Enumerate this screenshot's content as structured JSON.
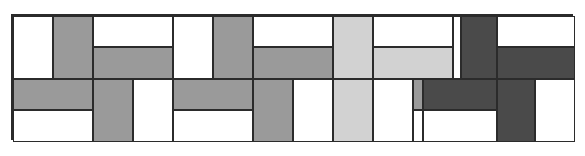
{
  "figure": {
    "border_color": "#2b2b2b",
    "background_color": "#ffffff",
    "canvas": {
      "x": 11,
      "y": 14,
      "width": 562,
      "height": 126
    }
  },
  "palette": {
    "white": "#ffffff",
    "gray": "#9a9a9a",
    "light_gray": "#d2d2d2",
    "dark_gray": "#4a4a4a",
    "outline": "#2b2b2b"
  },
  "chart_data": {
    "type": "table",
    "grid": {
      "unit_width": 40,
      "unit_height": 63,
      "columns": 14,
      "rows": 2
    },
    "legend": [
      {
        "name": "white",
        "color": "#ffffff"
      },
      {
        "name": "gray",
        "color": "#9a9a9a"
      },
      {
        "name": "light_gray",
        "color": "#d2d2d2"
      },
      {
        "name": "dark_gray",
        "color": "#4a4a4a"
      }
    ],
    "tiles": [
      {
        "x": 0,
        "y": 0,
        "w": 40,
        "h": 63,
        "fill": "#ffffff"
      },
      {
        "x": 40,
        "y": 0,
        "w": 40,
        "h": 63,
        "fill": "#9a9a9a"
      },
      {
        "x": 80,
        "y": 0,
        "w": 80,
        "h": 31,
        "fill": "#ffffff"
      },
      {
        "x": 80,
        "y": 31,
        "w": 80,
        "h": 32,
        "fill": "#9a9a9a"
      },
      {
        "x": 0,
        "y": 63,
        "w": 80,
        "h": 31,
        "fill": "#9a9a9a"
      },
      {
        "x": 0,
        "y": 94,
        "w": 80,
        "h": 32,
        "fill": "#ffffff"
      },
      {
        "x": 80,
        "y": 63,
        "w": 40,
        "h": 63,
        "fill": "#9a9a9a"
      },
      {
        "x": 120,
        "y": 63,
        "w": 40,
        "h": 63,
        "fill": "#ffffff"
      },
      {
        "x": 160,
        "y": 0,
        "w": 40,
        "h": 63,
        "fill": "#ffffff"
      },
      {
        "x": 200,
        "y": 0,
        "w": 40,
        "h": 63,
        "fill": "#9a9a9a"
      },
      {
        "x": 240,
        "y": 0,
        "w": 80,
        "h": 31,
        "fill": "#ffffff"
      },
      {
        "x": 240,
        "y": 31,
        "w": 80,
        "h": 32,
        "fill": "#9a9a9a"
      },
      {
        "x": 160,
        "y": 63,
        "w": 80,
        "h": 31,
        "fill": "#9a9a9a"
      },
      {
        "x": 160,
        "y": 94,
        "w": 80,
        "h": 32,
        "fill": "#ffffff"
      },
      {
        "x": 240,
        "y": 63,
        "w": 40,
        "h": 63,
        "fill": "#9a9a9a"
      },
      {
        "x": 280,
        "y": 63,
        "w": 40,
        "h": 63,
        "fill": "#ffffff"
      },
      {
        "x": 320,
        "y": 0,
        "w": 40,
        "h": 63,
        "fill": "#d2d2d2"
      },
      {
        "x": 360,
        "y": 0,
        "w": 80,
        "h": 31,
        "fill": "#ffffff"
      },
      {
        "x": 360,
        "y": 31,
        "w": 80,
        "h": 32,
        "fill": "#d2d2d2"
      },
      {
        "x": 440,
        "y": 0,
        "w": 40,
        "h": 63,
        "fill": "#ffffff"
      },
      {
        "x": 320,
        "y": 63,
        "w": 40,
        "h": 63,
        "fill": "#d2d2d2"
      },
      {
        "x": 360,
        "y": 63,
        "w": 40,
        "h": 63,
        "fill": "#ffffff"
      },
      {
        "x": 400,
        "y": 63,
        "w": 80,
        "h": 31,
        "fill": "#9a9a9a"
      },
      {
        "x": 400,
        "y": 94,
        "w": 80,
        "h": 32,
        "fill": "#ffffff"
      },
      {
        "x": 480,
        "y": 0,
        "w": 40,
        "h": 63,
        "fill": "#9a9a9a"
      },
      {
        "x": 520,
        "y": 0,
        "w": 42,
        "h": 63,
        "fill": "#ffffff"
      },
      {
        "x": 480,
        "y": 63,
        "w": 40,
        "h": 63,
        "fill": "#9a9a9a"
      },
      {
        "x": 520,
        "y": 63,
        "w": 42,
        "h": 31,
        "fill": "#9a9a9a"
      },
      {
        "x": 520,
        "y": 94,
        "w": 42,
        "h": 32,
        "fill": "#ffffff"
      }
    ],
    "accent_tiles": [
      {
        "x": 448,
        "y": 0,
        "w": 36,
        "h": 63,
        "fill": "#4a4a4a"
      },
      {
        "x": 484,
        "y": 0,
        "w": 78,
        "h": 31,
        "fill": "#ffffff"
      },
      {
        "x": 484,
        "y": 31,
        "w": 78,
        "h": 32,
        "fill": "#4a4a4a"
      },
      {
        "x": 410,
        "y": 63,
        "w": 74,
        "h": 31,
        "fill": "#4a4a4a"
      },
      {
        "x": 410,
        "y": 94,
        "w": 74,
        "h": 32,
        "fill": "#ffffff"
      },
      {
        "x": 484,
        "y": 63,
        "w": 38,
        "h": 63,
        "fill": "#4a4a4a"
      },
      {
        "x": 522,
        "y": 63,
        "w": 40,
        "h": 63,
        "fill": "#ffffff"
      }
    ]
  }
}
